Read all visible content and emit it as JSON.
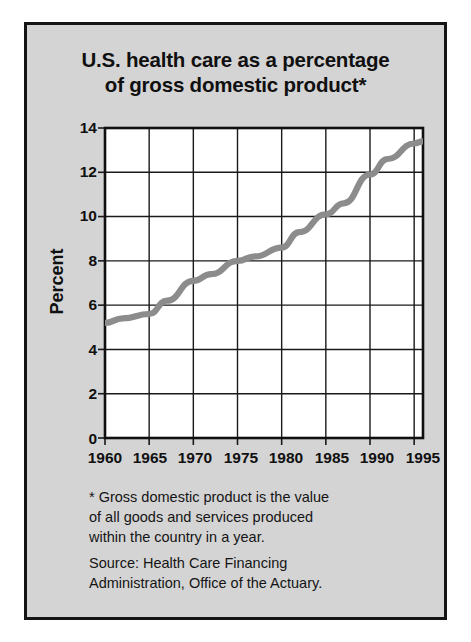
{
  "figure": {
    "title": "U.S. health care as a percentage\nof gross domestic product*",
    "footnote": "* Gross domestic product is the value\nof all goods and services produced\nwithin the country in a year.",
    "source": "Source: Health Care Financing\nAdministration, Office of the Actuary.",
    "panel_color": "#d4d4d4",
    "border_color": "#141414",
    "line_color": "#8c8c8c",
    "grid_color": "#1a1a1a"
  },
  "chart_data": {
    "type": "line",
    "title": "U.S. health care as a percentage of gross domestic product*",
    "xlabel": "",
    "ylabel": "Percent",
    "xlim": [
      1960,
      1996
    ],
    "ylim": [
      0,
      14
    ],
    "ytick_labels": [
      "0",
      "2",
      "4",
      "6",
      "8",
      "10",
      "12",
      "14"
    ],
    "ytick_values": [
      0,
      2,
      4,
      6,
      8,
      10,
      12,
      14
    ],
    "xtick_labels": [
      "1960",
      "1965",
      "1970",
      "1975",
      "1980",
      "1985",
      "1990",
      "1995"
    ],
    "xtick_values": [
      1960,
      1965,
      1970,
      1975,
      1980,
      1985,
      1990,
      1995
    ],
    "grid": true,
    "legend": "none",
    "series": [
      {
        "name": "Health care share of GDP",
        "x": [
          1960,
          1962,
          1965,
          1967,
          1970,
          1972,
          1975,
          1977,
          1980,
          1982,
          1985,
          1987,
          1990,
          1992,
          1995,
          1996
        ],
        "values": [
          5.2,
          5.4,
          5.6,
          6.2,
          7.1,
          7.4,
          8.0,
          8.2,
          8.6,
          9.3,
          10.1,
          10.6,
          11.9,
          12.6,
          13.3,
          13.4
        ]
      }
    ]
  }
}
